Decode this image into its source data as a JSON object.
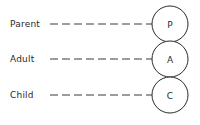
{
  "diagram": {
    "background_color": "#ffffff",
    "stroke_color": "#2b2b2b",
    "text_color": "#2b2b2b",
    "rows": [
      {
        "label": "Parent",
        "letter": "P",
        "label_y": 24,
        "circle_cx": 170,
        "circle_cy": 24,
        "line_x1": 50,
        "line_x2": 152
      },
      {
        "label": "Adult",
        "letter": "A",
        "label_y": 59,
        "circle_cx": 170,
        "circle_cy": 59,
        "line_x1": 50,
        "line_x2": 152
      },
      {
        "label": "Child",
        "letter": "C",
        "label_y": 95,
        "circle_cx": 170,
        "circle_cy": 95,
        "line_x1": 50,
        "line_x2": 152
      }
    ],
    "circle_diameter": 37,
    "dash_pattern": "8 4"
  }
}
